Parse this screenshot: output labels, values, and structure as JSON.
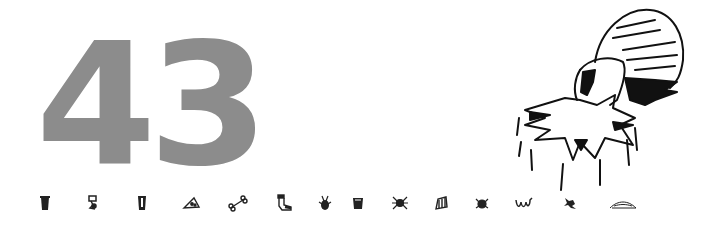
{
  "page": {
    "number": "43",
    "number_color": "#8c8c8c",
    "ink_color": "#111111"
  },
  "illustration": {
    "subject": "tick-biting-star-icon"
  },
  "icon_row": [
    {
      "name": "trash-can-icon",
      "x": 45
    },
    {
      "name": "robot-figure-icon",
      "x": 93
    },
    {
      "name": "cup-icon",
      "x": 142
    },
    {
      "name": "pizza-slice-icon",
      "x": 191
    },
    {
      "name": "bone-icon",
      "x": 238
    },
    {
      "name": "sock-icon",
      "x": 283
    },
    {
      "name": "bug-icon",
      "x": 325
    },
    {
      "name": "bucket-icon",
      "x": 358
    },
    {
      "name": "spider-icon",
      "x": 400
    },
    {
      "name": "trash-bag-icon",
      "x": 441
    },
    {
      "name": "tick-icon",
      "x": 482
    },
    {
      "name": "worm-icon",
      "x": 524
    },
    {
      "name": "lizard-icon",
      "x": 570
    },
    {
      "name": "leaf-icon",
      "x": 622
    }
  ]
}
